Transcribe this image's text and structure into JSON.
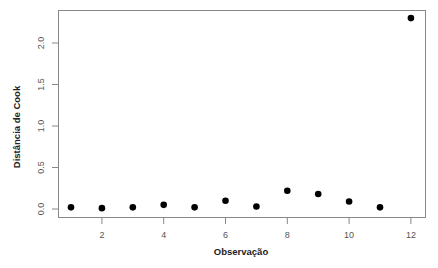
{
  "chart_data": {
    "type": "scatter",
    "title": "",
    "xlabel": "Observação",
    "ylabel": "Distância de Cook",
    "x": [
      1,
      2,
      3,
      4,
      5,
      6,
      7,
      8,
      9,
      10,
      11,
      12
    ],
    "values": [
      0.02,
      0.01,
      0.02,
      0.05,
      0.02,
      0.1,
      0.03,
      0.22,
      0.18,
      0.09,
      0.02,
      2.3
    ],
    "xlim": [
      0.55,
      12.45
    ],
    "ylim": [
      -0.1,
      2.4
    ],
    "x_ticks": [
      2,
      4,
      6,
      8,
      10,
      12
    ],
    "x_tick_labels": [
      "2",
      "4",
      "6",
      "8",
      "10",
      "12"
    ],
    "y_ticks": [
      0.0,
      0.5,
      1.0,
      1.5,
      2.0
    ],
    "y_tick_labels": [
      "0.0",
      "0.5",
      "1.0",
      "1.5",
      "2.0"
    ],
    "grid": false,
    "legend": null,
    "marker": "filled-circle",
    "marker_color": "#000000",
    "axis_color": "#888888"
  }
}
